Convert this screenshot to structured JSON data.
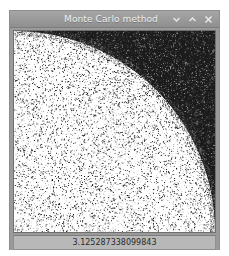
{
  "window": {
    "title": "Monte Carlo method",
    "controls": [
      {
        "name": "minimize",
        "glyph": "chevron-down"
      },
      {
        "name": "maximize",
        "glyph": "chevron-up"
      },
      {
        "name": "close",
        "glyph": "x"
      }
    ]
  },
  "status": {
    "pi_estimate": "3.125287338099843"
  },
  "colors": {
    "titlebar_top": "#a6a6a6",
    "titlebar_bottom": "#8f8f8f",
    "title_text": "#efefef",
    "window_frame": "#9a9a9a",
    "statusbar_bg": "#b8b8b8",
    "status_text": "#2b2b2b",
    "canvas_bg": "#ffffff",
    "dot_inside": "#303030",
    "dot_outside": "#101010",
    "outside_fill": "#1b1b1b"
  },
  "chart_data": {
    "type": "scatter",
    "title": "Monte Carlo method",
    "xlabel": "x",
    "ylabel": "y",
    "xlim": [
      0,
      1
    ],
    "ylim": [
      0,
      1
    ],
    "grid": false,
    "legend": false,
    "circle": {
      "center_x": 0,
      "center_y": 0,
      "radius": 1,
      "quadrant": "bottom-left-origin"
    },
    "point_counts": {
      "inside_rendered": 9000,
      "outside_rendered": 14000
    },
    "point_density": {
      "inside": "sparse",
      "outside": "dense"
    },
    "estimate_label": "3.125287338099843",
    "estimated_pi": 3.125287338099843
  }
}
